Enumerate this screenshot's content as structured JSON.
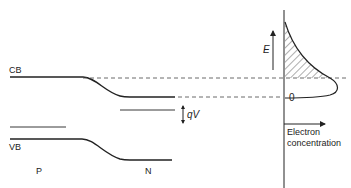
{
  "diagram": {
    "labels": {
      "conduction_band": "CB",
      "valence_band": "VB",
      "p_region": "P",
      "n_region": "N",
      "voltage": "qV",
      "energy_axis": "E",
      "zero_level": "0",
      "x_axis_line1": "Electron",
      "x_axis_line2": "concentration"
    },
    "colors": {
      "line": "#222222",
      "dashed": "#444444",
      "background": "#ffffff"
    }
  }
}
